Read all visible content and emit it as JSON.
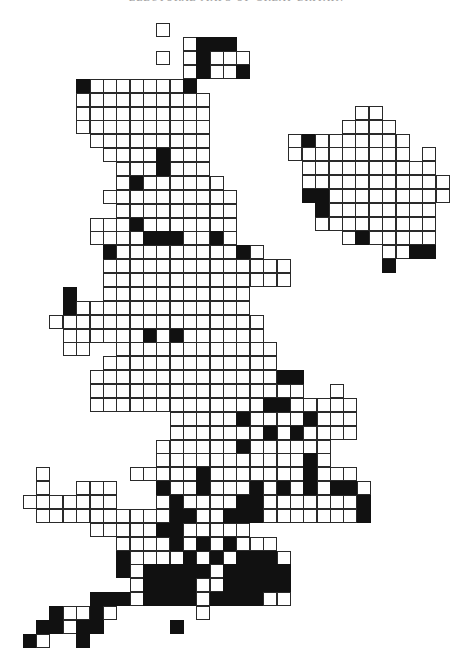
{
  "page": {
    "header_text": "ELECTORAL MAPS OF GREAT BRITAIN"
  },
  "colors": {
    "background": "#ffffff",
    "filled": "#111111",
    "empty": "#ffffff",
    "gridline": "#2a2a2a"
  },
  "legend": {
    "filled_cell": "constituency (black)",
    "empty_cell": "constituency (white)"
  },
  "regions": [
    {
      "name": "great-britain",
      "origin_x": 22.7,
      "origin_y": 23.3,
      "step_x": 13.36,
      "step_y": 13.875,
      "cell_size": 14,
      "col_start": -4,
      "legend": "o = unfilled square, # = filled square, . = no square",
      "rows": [
        "..........o...............",
        "............o###..........",
        "..........o.o#ooo.........",
        "............o#oo#.........",
        "....#ooooooo#.............",
        "....oooooooooo............",
        "....oooooooooo............",
        "....oooooooooo............",
        ".....ooooooooo............",
        "......oooo#ooo............",
        ".......ooo#ooo............",
        ".......o#oooooo...........",
        "......oooooooooo..........",
        ".......ooooooooo..........",
        ".....ooo#ooooooo..........",
        ".....oooo###oo#o..........",
        "......#ooooooooo#o........",
        "......oooooooooooooo......",
        "......oooooooooooooo......",
        "...#..ooooooooooo.........",
        "...#ooooooooooooo.........",
        "..oooooooooooooooo........",
        "...oooooo#o#oooooo........",
        "...oo..oooooooooooo.......",
        "......ooooooooooooo.......",
        ".....oooooooooooooo##.....",
        ".....oooooooooooooooo..o..",
        ".....ooooooooooooo##ooooo.",
        "...........ooooo#oooo#ooo.",
        "...........ooooooo#o#oooo.",
        "..........oooooo#oooooo...",
        "..........ooooooooooo#o...",
        ".o......ooooo#ooooooo#ooo.",
        ".o..ooo...#oo#ooo#o#o#o##o",
        "ooooooo...o#oooo##ooooooo#",
        ".oooooooooo##oo###ooooooo#",
        ".....ooooo##ooooo.........",
        ".......oooo#o#o#ooo.......",
        ".......#oooo#o#o###o......",
        ".......#o#####o#####......",
        "........o####oo#####......",
        ".....###o####o####oo......",
        "..#oo#o......o............",
        ".##o##.....#..............",
        "#o..#....................."
      ]
    },
    {
      "name": "northern-ireland",
      "origin_x": 288.3,
      "origin_y": 105.7,
      "step_x": 13.4,
      "step_y": 13.9,
      "cell_size": 14,
      "col_start": 0,
      "legend": "o = unfilled square, # = filled square, . = no square",
      "rows": [
        ".....oo.....",
        "....oooo....",
        "o#ooooooo...",
        "ooooooooo.o.",
        ".oooooooooo.",
        ".ooooooooooo",
        ".##ooooooooo",
        "..#oooooooo.",
        "..ooooooooo.",
        "....o#ooooo.",
        ".......oo##.",
        ".......#...."
      ]
    }
  ]
}
